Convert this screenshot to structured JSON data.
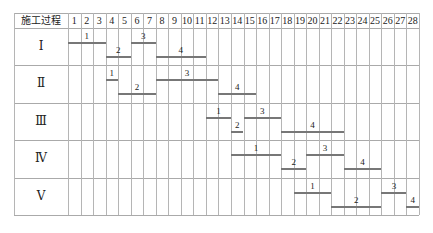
{
  "header": {
    "process_label": "施工过程",
    "days": [
      "1",
      "2",
      "3",
      "4",
      "5",
      "6",
      "7",
      "8",
      "9",
      "10",
      "11",
      "12",
      "13",
      "14",
      "15",
      "16",
      "17",
      "18",
      "19",
      "20",
      "21",
      "22",
      "23",
      "24",
      "25",
      "26",
      "27",
      "28"
    ]
  },
  "rows": [
    {
      "label": "Ⅰ",
      "bars": [
        {
          "label": "1",
          "start": 1,
          "end": 3,
          "level": 0
        },
        {
          "label": "2",
          "start": 4,
          "end": 5,
          "level": 1
        },
        {
          "label": "3",
          "start": 6,
          "end": 7,
          "level": 0
        },
        {
          "label": "4",
          "start": 8,
          "end": 11,
          "level": 1
        }
      ]
    },
    {
      "label": "Ⅱ",
      "bars": [
        {
          "label": "1",
          "start": 4,
          "end": 4,
          "level": 0
        },
        {
          "label": "2",
          "start": 5,
          "end": 7,
          "level": 1
        },
        {
          "label": "3",
          "start": 8,
          "end": 12,
          "level": 0
        },
        {
          "label": "4",
          "start": 13,
          "end": 15,
          "level": 1
        }
      ]
    },
    {
      "label": "Ⅲ",
      "bars": [
        {
          "label": "1",
          "start": 12,
          "end": 13,
          "level": 0
        },
        {
          "label": "2",
          "start": 14,
          "end": 14,
          "level": 1
        },
        {
          "label": "3",
          "start": 15,
          "end": 17,
          "level": 0
        },
        {
          "label": "4",
          "start": 18,
          "end": 22,
          "level": 1
        }
      ]
    },
    {
      "label": "Ⅳ",
      "bars": [
        {
          "label": "1",
          "start": 14,
          "end": 17,
          "level": 0
        },
        {
          "label": "2",
          "start": 18,
          "end": 19,
          "level": 1
        },
        {
          "label": "3",
          "start": 20,
          "end": 22,
          "level": 0
        },
        {
          "label": "4",
          "start": 23,
          "end": 25,
          "level": 1
        }
      ]
    },
    {
      "label": "Ⅴ",
      "bars": [
        {
          "label": "1",
          "start": 19,
          "end": 21,
          "level": 0
        },
        {
          "label": "2",
          "start": 22,
          "end": 25,
          "level": 1
        },
        {
          "label": "3",
          "start": 26,
          "end": 27,
          "level": 0
        },
        {
          "label": "4",
          "start": 28,
          "end": 28,
          "level": 1
        }
      ]
    }
  ],
  "colors": {
    "grid": "#b5b5b5",
    "bar": "#777777"
  }
}
